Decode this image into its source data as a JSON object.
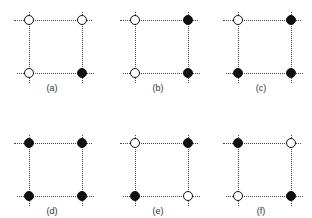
{
  "diagram": {
    "colors": {
      "line": "#444444",
      "filled": "#111111",
      "open": "#ffffff"
    },
    "panels": [
      {
        "label": "(a)",
        "nodes": {
          "top_left": "open",
          "top_right": "open",
          "bottom_left": "open",
          "bottom_right": "filled"
        }
      },
      {
        "label": "(b)",
        "nodes": {
          "top_left": "open",
          "top_right": "filled",
          "bottom_left": "open",
          "bottom_right": "filled"
        }
      },
      {
        "label": "(c)",
        "nodes": {
          "top_left": "open",
          "top_right": "filled",
          "bottom_left": "filled",
          "bottom_right": "filled"
        }
      },
      {
        "label": "(d)",
        "nodes": {
          "top_left": "filled",
          "top_right": "filled",
          "bottom_left": "filled",
          "bottom_right": "filled"
        }
      },
      {
        "label": "(e)",
        "nodes": {
          "top_left": "open",
          "top_right": "filled",
          "bottom_left": "filled",
          "bottom_right": "open"
        }
      },
      {
        "label": "(f)",
        "nodes": {
          "top_left": "filled",
          "top_right": "open",
          "bottom_left": "open",
          "bottom_right": "filled"
        }
      }
    ]
  }
}
